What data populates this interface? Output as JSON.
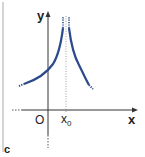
{
  "figure": {
    "panel_label": "c",
    "axes": {
      "x_label": "x",
      "y_label": "y",
      "origin_label": "O",
      "tick_label": "x",
      "tick_subscript": "0"
    },
    "colors": {
      "curve": "#2b4a8c",
      "axes": "#333333",
      "border": "#999999"
    }
  }
}
